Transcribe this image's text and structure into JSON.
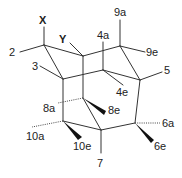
{
  "colors": {
    "bond": "#333333",
    "label": "#222222",
    "background": "#ffffff"
  },
  "labels": {
    "X": "X",
    "Y": "Y",
    "c2": "2",
    "c3": "3",
    "c4a": "4a",
    "c4e": "4e",
    "c5": "5",
    "c6a": "6a",
    "c6e": "6e",
    "c7": "7",
    "c8a": "8a",
    "c8e": "8e",
    "c9a": "9a",
    "c9e": "9e",
    "c10a": "10a",
    "c10e": "10e"
  }
}
